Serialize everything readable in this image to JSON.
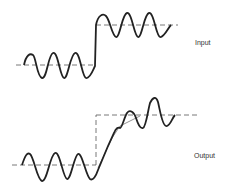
{
  "diagram": {
    "input": {
      "label": "Input",
      "low_baseline_y": 65,
      "high_baseline_y": 25,
      "step_x": 96,
      "cycles_each_side": 3
    },
    "output": {
      "label": "Output",
      "low_baseline_y": 165,
      "high_baseline_y": 115,
      "step_x": 96
    }
  }
}
